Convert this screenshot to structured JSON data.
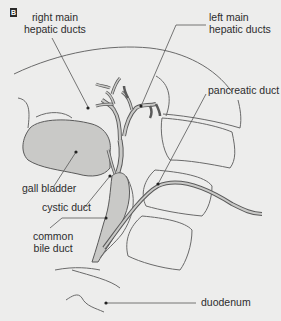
{
  "figure": {
    "panel_letter": "B",
    "background_color": "#ededec",
    "fill_color": "#c9c9c7",
    "stroke_color": "#5a5a5a"
  },
  "labels": {
    "right_hepatic": {
      "line1": "right main",
      "line2": "hepatic ducts"
    },
    "left_hepatic": {
      "line1": "left main",
      "line2": "hepatic ducts"
    },
    "pancreatic_duct": "pancreatic duct",
    "gall_bladder": "gall bladder",
    "cystic_duct": "cystic duct",
    "common_bile_duct": {
      "line1": "common",
      "line2": "bile duct"
    },
    "duodenum": "duodenum"
  }
}
